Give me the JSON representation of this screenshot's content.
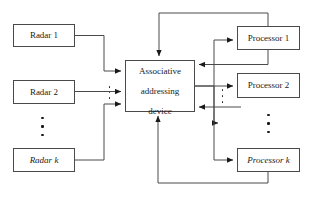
{
  "diagram": {
    "type": "block-diagram",
    "line_color": "#4a4a4a",
    "arrow_color": "#1a1a1a",
    "background": "#ffffff",
    "nodes": {
      "radar_1": {
        "label": "Radar 1",
        "name": "Radar",
        "index": "1"
      },
      "radar_2": {
        "label": "Radar 2",
        "name": "Radar",
        "index": "2"
      },
      "radar_k": {
        "label": "Radar k",
        "name": "Radar",
        "index": "k",
        "index_italic": true
      },
      "center": {
        "label": "Associative addressing device",
        "line1": "Associative",
        "line2": "addressing",
        "line3": "device"
      },
      "processor_1": {
        "label": "Processor 1",
        "name": "Processor",
        "index": "1"
      },
      "processor_2": {
        "label": "Processor 2",
        "name": "Processor",
        "index": "2"
      },
      "processor_k": {
        "label": "Processor k",
        "name": "Processor",
        "index": "k",
        "index_italic": true
      }
    },
    "ellipsis": {
      "radar_column": "⋮",
      "radar_inputs": "⋮",
      "processor_inputs": "⋮",
      "processor_column": "⋮"
    },
    "edges": [
      {
        "from": "radar_1",
        "to": "center",
        "direction": "forward"
      },
      {
        "from": "radar_2",
        "to": "center",
        "direction": "forward"
      },
      {
        "from": "radar_k",
        "to": "center",
        "direction": "forward"
      },
      {
        "from": "center",
        "to": "processor_1",
        "direction": "forward"
      },
      {
        "from": "center",
        "to": "processor_2",
        "direction": "forward"
      },
      {
        "from": "center",
        "to": "processor_k",
        "direction": "forward"
      },
      {
        "from": "processor_1",
        "to": "center",
        "direction": "feedback-top"
      },
      {
        "from": "processor_2",
        "to": "center",
        "direction": "feedback-right"
      },
      {
        "from": "processor_k",
        "to": "center",
        "direction": "feedback-bottom"
      }
    ]
  }
}
